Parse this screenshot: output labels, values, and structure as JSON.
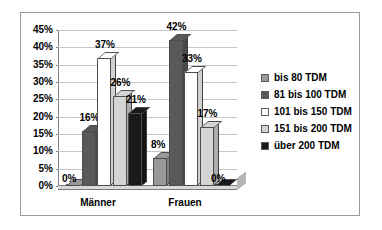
{
  "chart_data": {
    "type": "bar",
    "title": "",
    "subtitle": "",
    "xlabel": "",
    "ylabel": "",
    "categories": [
      "Männer",
      "Frauen"
    ],
    "series": [
      {
        "name": "bis 80 TDM",
        "values": [
          0,
          8
        ],
        "color": "#999999"
      },
      {
        "name": "81 bis 100 TDM",
        "values": [
          16,
          42
        ],
        "color": "#595959"
      },
      {
        "name": "101 bis 150 TDM",
        "values": [
          37,
          33
        ],
        "color": "#ffffff"
      },
      {
        "name": "151 bis 200 TDM",
        "values": [
          26,
          17
        ],
        "color": "#d4d4d4"
      },
      {
        "name": "über 200 TDM",
        "values": [
          21,
          0
        ],
        "color": "#1a1a1a"
      }
    ],
    "value_labels": [
      [
        "0%",
        "16%",
        "37%",
        "26%",
        "21%"
      ],
      [
        "8%",
        "42%",
        "33%",
        "17%",
        "0%"
      ]
    ],
    "ylim": [
      0,
      45
    ],
    "ytick_step": 5,
    "yticks": [
      "0%",
      "5%",
      "10%",
      "15%",
      "20%",
      "25%",
      "30%",
      "35%",
      "40%",
      "45%"
    ],
    "grid": true,
    "legend_position": "right",
    "three_d": true
  },
  "legend": {
    "items": [
      {
        "label": "bis 80 TDM",
        "color": "#999999"
      },
      {
        "label": "81 bis 100 TDM",
        "color": "#595959"
      },
      {
        "label": "101 bis 150 TDM",
        "color": "#ffffff"
      },
      {
        "label": "151 bis 200 TDM",
        "color": "#d4d4d4"
      },
      {
        "label": "über 200 TDM",
        "color": "#1a1a1a"
      }
    ]
  },
  "axis": {
    "y_labels": [
      "45%",
      "40%",
      "35%",
      "30%",
      "25%",
      "20%",
      "15%",
      "10%",
      "5%",
      "0%"
    ],
    "x_labels": [
      "Männer",
      "Frauen"
    ]
  },
  "colors": {
    "frame": "#9a9a9a",
    "gridline": "#c6c6c6",
    "axis": "#808080",
    "plot_background": "#ffffff",
    "bar_outline": "#4d4d4d",
    "floor": "#d9d9d9",
    "text": "#000000"
  }
}
